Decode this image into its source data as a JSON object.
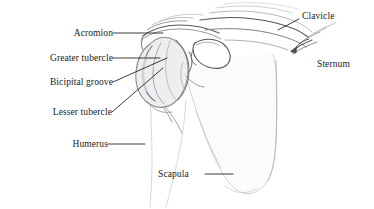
{
  "figure": {
    "style": "pencil-sketch line drawing",
    "background_color": "#ffffff",
    "ink_color": "#1a1a1a",
    "sketch_color": "#6e6e73",
    "sketch_light_color": "#b9b9bd",
    "shade_color": "#dcdcdf"
  },
  "labels": [
    {
      "id": "acromion",
      "text": "Acromion",
      "x": 57,
      "y": 29,
      "align": "right",
      "leader": {
        "type": "horizontal",
        "x1": 113,
        "y1": 33,
        "x2": 163,
        "y2": 33
      }
    },
    {
      "id": "greater-tubercle",
      "text": "Greater tubercle",
      "x": 21,
      "y": 54,
      "align": "right",
      "leader": {
        "type": "horizontal",
        "x1": 113,
        "y1": 58,
        "x2": 160,
        "y2": 58
      }
    },
    {
      "id": "bicipital-groove",
      "text": "Bicipital groove",
      "x": 23,
      "y": 80,
      "align": "right",
      "leader": {
        "type": "diagonal",
        "x1": 113,
        "y1": 82,
        "x2": 167,
        "y2": 58
      }
    },
    {
      "id": "lesser-tubercle",
      "text": "Lesser tubercle",
      "x": 25,
      "y": 110,
      "align": "right",
      "leader": {
        "type": "diagonal",
        "x1": 112,
        "y1": 112,
        "x2": 163,
        "y2": 68
      }
    },
    {
      "id": "humerus",
      "text": "Humerus",
      "x": 57,
      "y": 140,
      "align": "right",
      "leader": {
        "type": "horizontal",
        "x1": 108,
        "y1": 144,
        "x2": 145,
        "y2": 144
      }
    },
    {
      "id": "scapula",
      "text": "Scapula",
      "x": 158,
      "y": 170,
      "align": "left",
      "leader": {
        "type": "horizontal",
        "x1": 205,
        "y1": 174,
        "x2": 233,
        "y2": 174
      }
    },
    {
      "id": "clavicle",
      "text": "Clavicle",
      "x": 302,
      "y": 12,
      "align": "left",
      "leader": {
        "type": "diagonal",
        "x1": 299,
        "y1": 19,
        "x2": 278,
        "y2": 30
      }
    },
    {
      "id": "sternum",
      "text": "Sternum",
      "x": 317,
      "y": 60,
      "align": "left",
      "leader": null
    }
  ],
  "structures": [
    {
      "id": "humeral-head",
      "name": "humeral head"
    },
    {
      "id": "acromion-process",
      "name": "acromion process"
    },
    {
      "id": "coracoid-process",
      "name": "coracoid process"
    },
    {
      "id": "clavicle-shaft",
      "name": "clavicle shaft"
    },
    {
      "id": "scapula-body",
      "name": "scapula body"
    },
    {
      "id": "humerus-shaft",
      "name": "humerus shaft"
    },
    {
      "id": "sternum-ribs",
      "name": "sternum and costal cartilage"
    }
  ]
}
